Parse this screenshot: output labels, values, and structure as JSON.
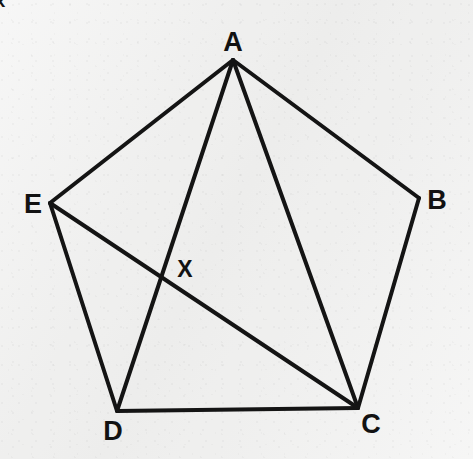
{
  "figure": {
    "kind": "geometry-diagram",
    "shape": "regular-pentagon-with-diagonals",
    "canvas": {
      "width": 473,
      "height": 459
    },
    "background_color": "#efefee",
    "stroke_color": "#141414",
    "label_color": "#121212"
  },
  "vertices": [
    {
      "id": "A",
      "label": "A",
      "x": 233,
      "y": 60,
      "label_x": 233,
      "label_y": 42
    },
    {
      "id": "B",
      "label": "B",
      "x": 419,
      "y": 198,
      "label_x": 437,
      "label_y": 200
    },
    {
      "id": "C",
      "label": "C",
      "x": 358,
      "y": 408,
      "label_x": 371,
      "label_y": 424
    },
    {
      "id": "D",
      "label": "D",
      "x": 117,
      "y": 411,
      "label_x": 113,
      "label_y": 431
    },
    {
      "id": "E",
      "label": "E",
      "x": 50,
      "y": 203,
      "label_x": 33,
      "label_y": 204
    }
  ],
  "points": [
    {
      "id": "X",
      "label": "X",
      "x": 162,
      "y": 277,
      "label_x": 185,
      "label_y": 269,
      "description": "intersection-of-AD-and-EC"
    }
  ],
  "edges": [
    {
      "id": "AB",
      "from": "A",
      "to": "B",
      "type": "side",
      "width": 4
    },
    {
      "id": "BC",
      "from": "B",
      "to": "C",
      "type": "side",
      "width": 4
    },
    {
      "id": "CD",
      "from": "C",
      "to": "D",
      "type": "side",
      "width": 4
    },
    {
      "id": "DE",
      "from": "D",
      "to": "E",
      "type": "side",
      "width": 4
    },
    {
      "id": "EA",
      "from": "E",
      "to": "A",
      "type": "side",
      "width": 4
    },
    {
      "id": "AC",
      "from": "A",
      "to": "C",
      "type": "diagonal",
      "width": 4
    },
    {
      "id": "AD",
      "from": "A",
      "to": "D",
      "type": "diagonal",
      "width": 4
    },
    {
      "id": "EC",
      "from": "E",
      "to": "C",
      "type": "diagonal",
      "width": 4
    }
  ],
  "segment_labels": [
    {
      "id": "x-on-AC",
      "label": "x",
      "x": 313,
      "y": 241,
      "edge": "AC"
    }
  ]
}
